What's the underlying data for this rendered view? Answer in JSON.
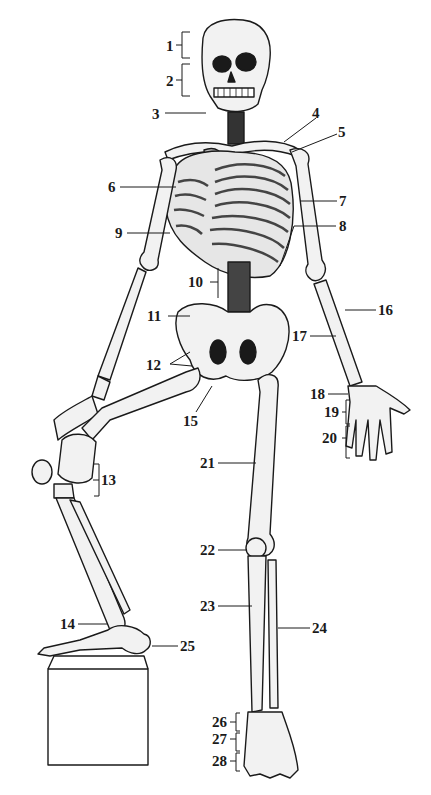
{
  "figure": {
    "ink_color": "#1a1a1a",
    "bone_fill": "#f2f2f2",
    "shade_color": "#555555",
    "background": "#ffffff"
  },
  "labels": [
    {
      "n": "1",
      "x": 166,
      "y": 39
    },
    {
      "n": "2",
      "x": 166,
      "y": 74
    },
    {
      "n": "3",
      "x": 152,
      "y": 107
    },
    {
      "n": "4",
      "x": 312,
      "y": 111
    },
    {
      "n": "5",
      "x": 338,
      "y": 129
    },
    {
      "n": "6",
      "x": 106,
      "y": 181
    },
    {
      "n": "7",
      "x": 339,
      "y": 195
    },
    {
      "n": "8",
      "x": 339,
      "y": 220
    },
    {
      "n": "9",
      "x": 113,
      "y": 227
    },
    {
      "n": "10",
      "x": 188,
      "y": 276
    },
    {
      "n": "11",
      "x": 147,
      "y": 310
    },
    {
      "n": "12",
      "x": 146,
      "y": 360
    },
    {
      "n": "13",
      "x": 84,
      "y": 474
    },
    {
      "n": "14",
      "x": 60,
      "y": 618
    },
    {
      "n": "15",
      "x": 183,
      "y": 416
    },
    {
      "n": "16",
      "x": 378,
      "y": 304
    },
    {
      "n": "17",
      "x": 294,
      "y": 330
    },
    {
      "n": "18",
      "x": 312,
      "y": 388
    },
    {
      "n": "19",
      "x": 326,
      "y": 406
    },
    {
      "n": "20",
      "x": 324,
      "y": 432
    },
    {
      "n": "21",
      "x": 202,
      "y": 457
    },
    {
      "n": "22",
      "x": 202,
      "y": 544
    },
    {
      "n": "23",
      "x": 202,
      "y": 600
    },
    {
      "n": "24",
      "x": 312,
      "y": 622
    },
    {
      "n": "25",
      "x": 180,
      "y": 640
    },
    {
      "n": "26",
      "x": 214,
      "y": 716
    },
    {
      "n": "27",
      "x": 214,
      "y": 733
    },
    {
      "n": "28",
      "x": 214,
      "y": 755
    }
  ]
}
